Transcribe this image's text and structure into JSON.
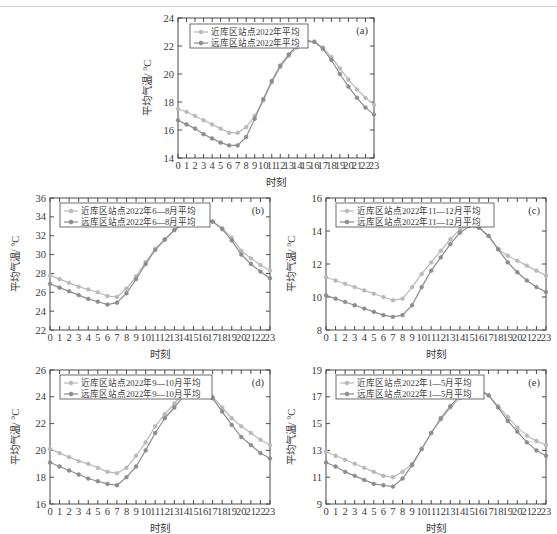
{
  "figure": {
    "axis_x_label": "时刻",
    "axis_y_label": "平均气温/ °C",
    "series_names": {
      "near": "近库区站点",
      "far": "远库区站点"
    },
    "colors": {
      "near": "#b9b9b9",
      "far": "#8d8d8d",
      "axis": "#4a4a4a",
      "text": "#3a3a3a",
      "background": "#ffffff"
    },
    "hours": [
      "0",
      "1",
      "2",
      "3",
      "4",
      "5",
      "6",
      "7",
      "8",
      "9",
      "10",
      "11",
      "12",
      "13",
      "14",
      "15",
      "16",
      "17",
      "18",
      "19",
      "20",
      "21",
      "22",
      "23"
    ]
  },
  "panels": [
    {
      "tag": "(a)",
      "legend": [
        "近库区站点2022年平均",
        "远库区站点2022年平均"
      ],
      "xlabel": "时刻",
      "ylabel": "平均气温/ °C",
      "yticks": [
        "14",
        "16",
        "18",
        "20",
        "22",
        "24"
      ]
    },
    {
      "tag": "(b)",
      "legend": [
        "近库区站点2022年6—8月平均",
        "远库区站点2022年6—8月平均"
      ],
      "xlabel": "时刻",
      "ylabel": "平均气温/ °C",
      "yticks": [
        "22",
        "24",
        "26",
        "28",
        "30",
        "32",
        "34",
        "36"
      ]
    },
    {
      "tag": "(c)",
      "legend": [
        "近库区站点2022年11—12月平均",
        "远库区站点2022年11—12月平均"
      ],
      "xlabel": "时刻",
      "ylabel": "平均气温/ °C",
      "yticks": [
        "8",
        "10",
        "12",
        "14",
        "16"
      ]
    },
    {
      "tag": "(d)",
      "legend": [
        "近库区站点2022年9—10月平均",
        "远库区站点2022年9—10月平均"
      ],
      "xlabel": "时刻",
      "ylabel": "平均气温/ °C",
      "yticks": [
        "16",
        "18",
        "20",
        "22",
        "24",
        "26"
      ]
    },
    {
      "tag": "(e)",
      "legend": [
        "近库区站点2022年1—5月平均",
        "远库区站点2022年1—5月平均"
      ],
      "xlabel": "时刻",
      "ylabel": "平均气温/ °C",
      "yticks": [
        "9",
        "11",
        "13",
        "15",
        "17",
        "19"
      ]
    }
  ],
  "chart_data": [
    {
      "type": "line",
      "panel": "(a)",
      "title": "2022年平均",
      "xlabel": "时刻",
      "ylabel": "平均气温/ °C",
      "x": [
        0,
        1,
        2,
        3,
        4,
        5,
        6,
        7,
        8,
        9,
        10,
        11,
        12,
        13,
        14,
        15,
        16,
        17,
        18,
        19,
        20,
        21,
        22,
        23
      ],
      "xlim": [
        0,
        23
      ],
      "ylim": [
        14,
        24
      ],
      "yticks": [
        14,
        16,
        18,
        20,
        22,
        24
      ],
      "grid": false,
      "legend_position": "top-left",
      "series": [
        {
          "name": "近库区站点2022年平均",
          "values": [
            17.5,
            17.3,
            17.0,
            16.7,
            16.4,
            16.1,
            15.8,
            15.8,
            16.2,
            17.0,
            18.1,
            19.4,
            20.5,
            21.3,
            21.9,
            22.3,
            22.3,
            21.9,
            21.2,
            20.4,
            19.6,
            18.9,
            18.3,
            17.8
          ]
        },
        {
          "name": "远库区站点2022年平均",
          "values": [
            16.7,
            16.4,
            16.1,
            15.7,
            15.4,
            15.1,
            14.9,
            14.9,
            15.5,
            16.8,
            18.2,
            19.5,
            20.6,
            21.4,
            22.1,
            22.4,
            22.3,
            21.8,
            21.0,
            20.0,
            19.1,
            18.3,
            17.6,
            17.1
          ]
        }
      ]
    },
    {
      "type": "line",
      "panel": "(b)",
      "title": "2022年6—8月平均",
      "xlabel": "时刻",
      "ylabel": "平均气温/ °C",
      "x": [
        0,
        1,
        2,
        3,
        4,
        5,
        6,
        7,
        8,
        9,
        10,
        11,
        12,
        13,
        14,
        15,
        16,
        17,
        18,
        19,
        20,
        21,
        22,
        23
      ],
      "xlim": [
        0,
        23
      ],
      "ylim": [
        22,
        36
      ],
      "yticks": [
        22,
        24,
        26,
        28,
        30,
        32,
        34,
        36
      ],
      "grid": false,
      "legend_position": "top-left",
      "series": [
        {
          "name": "近库区站点2022年6—8月平均",
          "values": [
            27.8,
            27.4,
            27.0,
            26.6,
            26.3,
            26.0,
            25.6,
            25.5,
            26.4,
            27.7,
            29.2,
            30.6,
            31.6,
            32.6,
            33.3,
            33.8,
            33.8,
            33.5,
            32.8,
            31.8,
            30.4,
            29.6,
            28.9,
            28.3
          ]
        },
        {
          "name": "远库区站点2022年6—8月平均",
          "values": [
            26.9,
            26.5,
            26.1,
            25.7,
            25.3,
            25.0,
            24.7,
            24.9,
            25.9,
            27.4,
            29.0,
            30.5,
            31.6,
            32.6,
            33.3,
            33.8,
            33.9,
            33.5,
            32.7,
            31.5,
            30.0,
            29.0,
            28.2,
            27.5
          ]
        }
      ]
    },
    {
      "type": "line",
      "panel": "(c)",
      "title": "2022年11—12月平均",
      "xlabel": "时刻",
      "ylabel": "平均气温/ °C",
      "x": [
        0,
        1,
        2,
        3,
        4,
        5,
        6,
        7,
        8,
        9,
        10,
        11,
        12,
        13,
        14,
        15,
        16,
        17,
        18,
        19,
        20,
        21,
        22,
        23
      ],
      "xlim": [
        0,
        23
      ],
      "ylim": [
        8,
        16
      ],
      "yticks": [
        8,
        10,
        12,
        14,
        16
      ],
      "grid": false,
      "legend_position": "top-left",
      "series": [
        {
          "name": "近库区站点2022年11—12月平均",
          "values": [
            11.2,
            11.0,
            10.8,
            10.6,
            10.4,
            10.2,
            10.0,
            9.8,
            9.9,
            10.6,
            11.4,
            12.1,
            12.8,
            13.5,
            14.1,
            14.4,
            14.2,
            13.7,
            12.9,
            12.5,
            12.2,
            11.9,
            11.6,
            11.3
          ]
        },
        {
          "name": "远库区站点2022年11—12月平均",
          "values": [
            10.1,
            9.9,
            9.7,
            9.5,
            9.3,
            9.1,
            8.9,
            8.8,
            8.9,
            9.5,
            10.6,
            11.6,
            12.4,
            13.2,
            13.9,
            14.3,
            14.2,
            13.7,
            12.9,
            12.1,
            11.5,
            11.0,
            10.6,
            10.3
          ]
        }
      ]
    },
    {
      "type": "line",
      "panel": "(d)",
      "title": "2022年9—10月平均",
      "xlabel": "时刻",
      "ylabel": "平均气温/ °C",
      "x": [
        0,
        1,
        2,
        3,
        4,
        5,
        6,
        7,
        8,
        9,
        10,
        11,
        12,
        13,
        14,
        15,
        16,
        17,
        18,
        19,
        20,
        21,
        22,
        23
      ],
      "xlim": [
        0,
        23
      ],
      "ylim": [
        16,
        26
      ],
      "yticks": [
        16,
        18,
        20,
        22,
        24,
        26
      ],
      "grid": false,
      "legend_position": "top-left",
      "series": [
        {
          "name": "近库区站点2022年9—10月平均",
          "values": [
            20.1,
            19.8,
            19.5,
            19.2,
            19.0,
            18.7,
            18.4,
            18.3,
            18.7,
            19.6,
            20.6,
            21.8,
            22.7,
            23.5,
            24.3,
            24.6,
            24.5,
            24.0,
            23.2,
            22.4,
            21.8,
            21.3,
            20.8,
            20.4
          ]
        },
        {
          "name": "远库区站点2022年9—10月平均",
          "values": [
            19.1,
            18.8,
            18.5,
            18.2,
            17.9,
            17.7,
            17.5,
            17.4,
            18.0,
            18.8,
            20.0,
            21.3,
            22.4,
            23.2,
            24.1,
            24.6,
            24.5,
            23.9,
            22.9,
            21.9,
            21.0,
            20.4,
            19.8,
            19.4
          ]
        }
      ]
    },
    {
      "type": "line",
      "panel": "(e)",
      "title": "2022年1—5月平均",
      "xlabel": "时刻",
      "ylabel": "平均气温/ °C",
      "x": [
        0,
        1,
        2,
        3,
        4,
        5,
        6,
        7,
        8,
        9,
        10,
        11,
        12,
        13,
        14,
        15,
        16,
        17,
        18,
        19,
        20,
        21,
        22,
        23
      ],
      "xlim": [
        0,
        23
      ],
      "ylim": [
        9,
        19
      ],
      "yticks": [
        9,
        11,
        13,
        15,
        17,
        19
      ],
      "grid": false,
      "legend_position": "top-left",
      "series": [
        {
          "name": "近库区站点2022年1—5月平均",
          "values": [
            12.9,
            12.6,
            12.3,
            12.0,
            11.7,
            11.4,
            11.1,
            11.0,
            11.4,
            12.0,
            13.1,
            14.3,
            15.3,
            16.2,
            16.9,
            17.4,
            17.5,
            17.1,
            16.3,
            15.5,
            14.7,
            14.1,
            13.7,
            13.4
          ]
        },
        {
          "name": "远库区站点2022年1—5月平均",
          "values": [
            12.1,
            11.8,
            11.4,
            11.1,
            10.8,
            10.5,
            10.4,
            10.3,
            10.9,
            11.9,
            13.1,
            14.3,
            15.4,
            16.3,
            17.1,
            17.6,
            17.6,
            17.1,
            16.2,
            15.2,
            14.4,
            13.6,
            13.0,
            12.6
          ]
        }
      ]
    }
  ]
}
